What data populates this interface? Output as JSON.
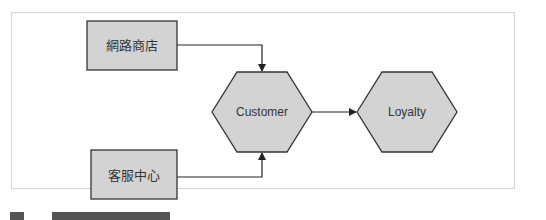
{
  "diagram": {
    "nodes": [
      {
        "id": "online-store",
        "label": "網路商店",
        "shape": "rectangle"
      },
      {
        "id": "service-center",
        "label": "客服中心",
        "shape": "rectangle"
      },
      {
        "id": "customer",
        "label": "Customer",
        "shape": "hexagon"
      },
      {
        "id": "loyalty",
        "label": "Loyalty",
        "shape": "hexagon"
      }
    ],
    "edges": [
      {
        "from": "online-store",
        "to": "customer"
      },
      {
        "from": "service-center",
        "to": "customer"
      },
      {
        "from": "customer",
        "to": "loyalty"
      }
    ],
    "colors": {
      "node_fill": "#d3d3d3",
      "node_stroke": "#333333",
      "edge": "#222222",
      "frame": "#d4d4d4"
    }
  }
}
